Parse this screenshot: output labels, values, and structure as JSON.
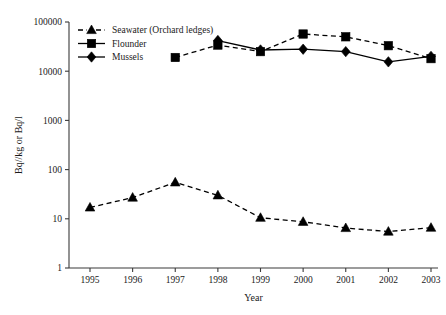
{
  "chart_data": {
    "type": "line",
    "title": "",
    "xlabel": "Year",
    "ylabel": "Bq//kg or Bq/l",
    "x": [
      1995,
      1996,
      1997,
      1998,
      1999,
      2000,
      2001,
      2002,
      2003
    ],
    "categories": [
      "1995",
      "1996",
      "1997",
      "1998",
      "1999",
      "2000",
      "2001",
      "2002",
      "2003"
    ],
    "yscale": "log",
    "ylim": [
      1,
      100000
    ],
    "ytick_labels": [
      "1",
      "10",
      "100",
      "1000",
      "10000",
      "100000"
    ],
    "ytick_values": [
      1,
      10,
      100,
      1000,
      10000,
      100000
    ],
    "grid": false,
    "legend_position": "top-left",
    "series": [
      {
        "name": "Seawater (Orchard ledges)",
        "marker": "triangle",
        "linestyle": "dashed",
        "color": "#000000",
        "x": [
          1995,
          1996,
          1997,
          1998,
          1999,
          2000,
          2001,
          2002,
          2003
        ],
        "values": [
          17,
          27,
          55,
          30,
          10.5,
          8.7,
          6.5,
          5.5,
          6.6
        ]
      },
      {
        "name": "Flounder",
        "marker": "square",
        "linestyle": "dashed",
        "color": "#000000",
        "x": [
          1997,
          1998,
          1999,
          2000,
          2001,
          2002,
          2003
        ],
        "values": [
          19000,
          34000,
          25000,
          57000,
          50000,
          33000,
          18000
        ]
      },
      {
        "name": "Mussels",
        "marker": "diamond",
        "linestyle": "solid",
        "color": "#000000",
        "x": [
          1998,
          1999,
          2000,
          2001,
          2002,
          2003
        ],
        "values": [
          42000,
          27000,
          28000,
          25000,
          15500,
          20000
        ]
      }
    ]
  },
  "legend": {
    "entries": [
      {
        "label": "Seawater (Orchard ledges)",
        "marker": "triangle",
        "linestyle": "dashed"
      },
      {
        "label": "Flounder",
        "marker": "square",
        "linestyle": "solid"
      },
      {
        "label": "Mussels",
        "marker": "diamond",
        "linestyle": "solid"
      }
    ]
  }
}
